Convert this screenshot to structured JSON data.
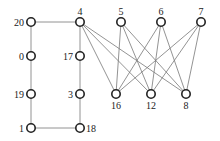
{
  "diagram": {
    "type": "graph",
    "nodes": [
      {
        "id": "20",
        "x": 31,
        "y": 22,
        "label_pos": "left"
      },
      {
        "id": "0",
        "x": 31,
        "y": 56,
        "label_pos": "left"
      },
      {
        "id": "19",
        "x": 31,
        "y": 94,
        "label_pos": "left"
      },
      {
        "id": "1",
        "x": 31,
        "y": 128,
        "label_pos": "left"
      },
      {
        "id": "4",
        "x": 80,
        "y": 22,
        "label_pos": "top"
      },
      {
        "id": "17",
        "x": 80,
        "y": 56,
        "label_pos": "left"
      },
      {
        "id": "3",
        "x": 80,
        "y": 94,
        "label_pos": "left"
      },
      {
        "id": "18",
        "x": 80,
        "y": 128,
        "label_pos": "right"
      },
      {
        "id": "5",
        "x": 121,
        "y": 22,
        "label_pos": "top"
      },
      {
        "id": "6",
        "x": 161,
        "y": 22,
        "label_pos": "top"
      },
      {
        "id": "7",
        "x": 201,
        "y": 22,
        "label_pos": "top"
      },
      {
        "id": "16",
        "x": 116,
        "y": 94,
        "label_pos": "bottom"
      },
      {
        "id": "12",
        "x": 151,
        "y": 94,
        "label_pos": "bottom"
      },
      {
        "id": "8",
        "x": 186,
        "y": 94,
        "label_pos": "bottom"
      }
    ],
    "edges": [
      [
        "20",
        "4"
      ],
      [
        "20",
        "0"
      ],
      [
        "0",
        "19"
      ],
      [
        "19",
        "1"
      ],
      [
        "1",
        "18"
      ],
      [
        "4",
        "17"
      ],
      [
        "17",
        "3"
      ],
      [
        "3",
        "18"
      ],
      [
        "4",
        "16"
      ],
      [
        "4",
        "12"
      ],
      [
        "4",
        "8"
      ],
      [
        "5",
        "16"
      ],
      [
        "5",
        "12"
      ],
      [
        "5",
        "8"
      ],
      [
        "6",
        "16"
      ],
      [
        "6",
        "12"
      ],
      [
        "6",
        "8"
      ],
      [
        "7",
        "16"
      ],
      [
        "7",
        "12"
      ],
      [
        "7",
        "8"
      ]
    ]
  }
}
